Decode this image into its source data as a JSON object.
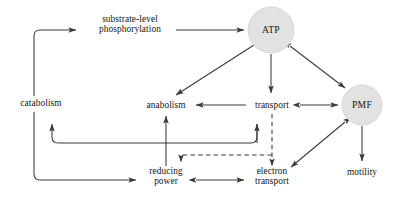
{
  "diagram": {
    "type": "flow-diagram",
    "background_color": "#ffffff",
    "line_color": "#3a3a3a",
    "circle_fill_color": "#e2e2e2",
    "text_color": "#141414",
    "nodes": [
      {
        "id": "catabolism",
        "label": "catabolism",
        "shape": "text",
        "x": 41,
        "y": 103
      },
      {
        "id": "substrate-level-phosphorylation",
        "label_line1": "substrate-level",
        "label_line2": "phosphorylation",
        "shape": "text",
        "x": 130,
        "y": 25
      },
      {
        "id": "atp",
        "label": "ATP",
        "shape": "circle",
        "x": 271,
        "y": 30,
        "r": 23
      },
      {
        "id": "anabolism",
        "label": "anabolism",
        "shape": "text",
        "x": 166,
        "y": 105
      },
      {
        "id": "transport",
        "label": "transport",
        "shape": "text",
        "x": 272,
        "y": 105
      },
      {
        "id": "pmf",
        "label": "PMF",
        "shape": "circle",
        "x": 362,
        "y": 105,
        "r": 20
      },
      {
        "id": "reducing-power",
        "label_line1": "reducing",
        "label_line2": "power",
        "shape": "text",
        "x": 166,
        "y": 176
      },
      {
        "id": "electron-transport",
        "label_line1": "electron",
        "label_line2": "transport",
        "shape": "text",
        "x": 272,
        "y": 176
      },
      {
        "id": "motility",
        "label": "motility",
        "shape": "text",
        "x": 362,
        "y": 172
      }
    ],
    "edges": [
      {
        "from": "catabolism",
        "to": "substrate-level-phosphorylation",
        "style": "solid",
        "arrow": "single"
      },
      {
        "from": "substrate-level-phosphorylation",
        "to": "atp",
        "style": "solid",
        "arrow": "single"
      },
      {
        "from": "atp",
        "to": "anabolism",
        "style": "solid",
        "arrow": "single"
      },
      {
        "from": "atp",
        "to": "transport",
        "style": "solid",
        "arrow": "single"
      },
      {
        "from": "atp",
        "to": "pmf",
        "style": "solid",
        "arrow": "double"
      },
      {
        "from": "transport",
        "to": "anabolism",
        "style": "solid",
        "arrow": "single"
      },
      {
        "from": "transport",
        "to": "pmf",
        "style": "solid",
        "arrow": "double"
      },
      {
        "from": "transport",
        "to": "electron-transport",
        "style": "dashed",
        "arrow": "single"
      },
      {
        "from": "transport",
        "to": "reducing-power",
        "style": "dashed",
        "arrow": "single"
      },
      {
        "from": "pmf",
        "to": "electron-transport",
        "style": "solid",
        "arrow": "double"
      },
      {
        "from": "pmf",
        "to": "motility",
        "style": "solid",
        "arrow": "single"
      },
      {
        "from": "reducing-power",
        "to": "anabolism",
        "style": "solid",
        "arrow": "single"
      },
      {
        "from": "reducing-power",
        "to": "electron-transport",
        "style": "solid",
        "arrow": "double"
      },
      {
        "from": "catabolism",
        "to": "reducing-power",
        "style": "solid",
        "arrow": "single"
      },
      {
        "from": "electron-transport",
        "to": "catabolism-return",
        "style": "solid",
        "arrow": "single"
      },
      {
        "from": "electron-transport",
        "to": "transport-return",
        "style": "solid",
        "arrow": "single"
      }
    ]
  }
}
